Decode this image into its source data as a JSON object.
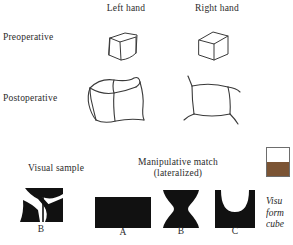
{
  "figure": {
    "columns": [
      {
        "label": "Left hand"
      },
      {
        "label": "Right hand"
      }
    ],
    "rows": [
      {
        "label": "Preoperative"
      },
      {
        "label": "Postoperative"
      }
    ],
    "drawings": [
      {
        "name": "preoperative-left-hand-cube",
        "condition": "Preoperative",
        "hand": "Left hand",
        "style": "small neat cube"
      },
      {
        "name": "preoperative-right-hand-cube",
        "condition": "Preoperative",
        "hand": "Right hand",
        "style": "small neat cube"
      },
      {
        "name": "postoperative-left-hand-cube",
        "condition": "Postoperative",
        "hand": "Left hand",
        "style": "large distorted wobbly cube"
      },
      {
        "name": "postoperative-right-hand-cube",
        "condition": "Postoperative",
        "hand": "Right hand",
        "style": "flattened square with stray corner strokes"
      }
    ]
  },
  "bottom": {
    "visual_sample_heading": "Visual sample",
    "manipulative_heading_line1": "Manipulative match",
    "manipulative_heading_line2": "(lateralized)",
    "sample_label": "B",
    "options": [
      {
        "label": "A",
        "shape": "solid black rectangle"
      },
      {
        "label": "B",
        "shape": "hourglass with concave sides"
      },
      {
        "label": "C",
        "shape": "square with semicircular bite from top"
      }
    ]
  },
  "side": {
    "caption_line1": "Visu",
    "caption_line2": "form",
    "caption_line3": "cube",
    "swatch_top_color": "#ffffff",
    "swatch_bottom_color": "#7b5434"
  },
  "colors": {
    "ink": "#1a1a1a",
    "shape_fill": "#111111",
    "brown": "#7b5434"
  }
}
